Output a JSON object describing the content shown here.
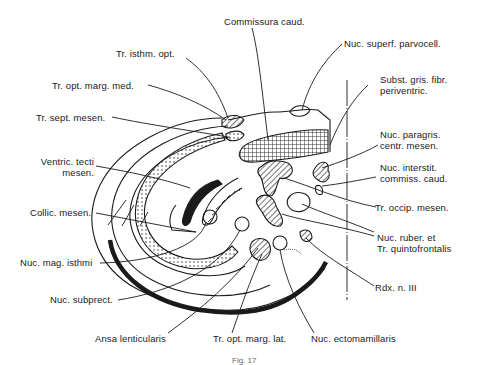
{
  "figure": {
    "caption": "Fig. 17",
    "type": "anatomical cross-section, mesencephalon (fish brain)"
  },
  "labels": {
    "commissura_caud": "Commissura caud.",
    "nuc_superf_parvocell": "Nuc. superf. parvocell.",
    "tr_isthm_opt": "Tr. isthm. opt.",
    "tr_opt_marg_med": "Tr. opt. marg. med.",
    "tr_sept_mesen": "Tr. sept. mesen.",
    "subst_gris_line1": "Subst. gris. fibr.",
    "subst_gris_line2": "periventric.",
    "nuc_paragris_line1": "Nuc. paragris.",
    "nuc_paragris_line2": "centr. mesen.",
    "nuc_interstit_line1": "Nuc. interstit.",
    "nuc_interstit_line2": "commiss. caud.",
    "ventric_line1": "Ventric. tecti",
    "ventric_line2": "mesen.",
    "collic_mesen": "Collic. mesen.",
    "tr_occip_mesen": "Tr. occip. mesen.",
    "nuc_mag_isthmi": "Nuc. mag. isthmi",
    "nuc_ruber_line1": "Nuc. ruber. et",
    "nuc_ruber_line2": "Tr. quintofrontalis",
    "rdx_n_iii": "Rdx. n. III",
    "nuc_subprect": "Nuc. subprect.",
    "ansa_lenticularis": "Ansa lenticularis",
    "tr_opt_marg_lat": "Tr. opt. marg. lat.",
    "nuc_ectomamillaris": "Nuc. ectomamillaris"
  },
  "colors": {
    "ink": "#1a1a1a",
    "background": "#ffffff"
  }
}
